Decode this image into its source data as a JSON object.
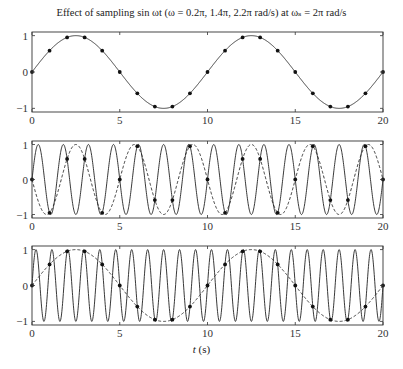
{
  "chart_data": [
    {
      "type": "line",
      "title": "Effect of sampling sin ωt (ω = 0.2π, 1.4π, 2.2π rad/s) at ωs = 2π rad/s",
      "xlabel": "",
      "ylabel": "",
      "xlim": [
        0,
        20
      ],
      "ylim": [
        -1.1,
        1.1
      ],
      "xticks": [
        0,
        5,
        10,
        15,
        20
      ],
      "yticks": [
        -1,
        0,
        1
      ],
      "series": [
        {
          "name": "sin(0.2πt)",
          "omega_over_pi": 0.2,
          "style": "solid"
        }
      ],
      "samples": {
        "t_start": 0,
        "t_end": 20,
        "t_step": 1,
        "omega_over_pi": 0.2
      },
      "box": {
        "left": 32,
        "right": 383,
        "top": 32,
        "bottom": 112
      }
    },
    {
      "type": "line",
      "xlim": [
        0,
        20
      ],
      "ylim": [
        -1.1,
        1.1
      ],
      "xticks": [
        0,
        5,
        10,
        15,
        20
      ],
      "yticks": [
        -1,
        0,
        1
      ],
      "series": [
        {
          "name": "sin(1.4πt)",
          "omega_over_pi": 1.4,
          "style": "solid"
        },
        {
          "name": "alias sin(-0.6πt)",
          "omega_over_pi": -0.6,
          "style": "dashed"
        }
      ],
      "samples": {
        "t_start": 0,
        "t_end": 20,
        "t_step": 1,
        "omega_over_pi": 1.4
      },
      "box": {
        "left": 32,
        "right": 383,
        "top": 141,
        "bottom": 218
      }
    },
    {
      "type": "line",
      "xlabel": "t (s)",
      "xlim": [
        0,
        20
      ],
      "ylim": [
        -1.1,
        1.1
      ],
      "xticks": [
        0,
        5,
        10,
        15,
        20
      ],
      "yticks": [
        -1,
        0,
        1
      ],
      "series": [
        {
          "name": "sin(2.2πt)",
          "omega_over_pi": 2.2,
          "style": "solid"
        },
        {
          "name": "alias sin(0.2πt)",
          "omega_over_pi": 0.2,
          "style": "dashed"
        }
      ],
      "samples": {
        "t_start": 0,
        "t_end": 20,
        "t_step": 1,
        "omega_over_pi": 2.2
      },
      "box": {
        "left": 32,
        "right": 383,
        "top": 246,
        "bottom": 325
      }
    }
  ],
  "figure": {
    "title": "Effect of sampling sin ωt (ω = 0.2π, 1.4π, 2.2π rad/s) at ωₛ = 2π rad/s",
    "xlabel": "t (s)"
  }
}
